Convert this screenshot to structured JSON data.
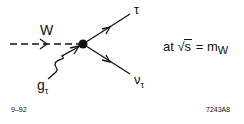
{
  "diagram": {
    "vertex": {
      "x": 83,
      "y": 44
    },
    "lines": [
      {
        "id": "W",
        "style": "dashed",
        "from": [
          10,
          44
        ],
        "to": [
          83,
          44
        ],
        "arrow": "right"
      },
      {
        "id": "tau",
        "style": "solid",
        "from": [
          83,
          44
        ],
        "to": [
          130,
          14
        ],
        "arrow": "outgoing"
      },
      {
        "id": "nu_tau",
        "style": "solid",
        "from": [
          83,
          44
        ],
        "to": [
          130,
          74
        ],
        "arrow": "outgoing"
      },
      {
        "id": "g_tau",
        "style": "wavy",
        "from": [
          48,
          78
        ],
        "to": [
          80,
          46
        ],
        "arrow": "incoming"
      }
    ],
    "labels": {
      "w": "W",
      "tau": "τ",
      "nu": "ν",
      "nu_sub": "τ",
      "g": "g",
      "g_sub": "τ"
    },
    "equation": {
      "prefix": "at ",
      "sqrt_sign": "√",
      "sqrt_arg": "s",
      "equals": " = m",
      "sub": "W"
    },
    "footer": {
      "left": "9–92",
      "right": "7243A8"
    },
    "colors": {
      "ink": "#111111",
      "background": "#ffffff"
    }
  }
}
